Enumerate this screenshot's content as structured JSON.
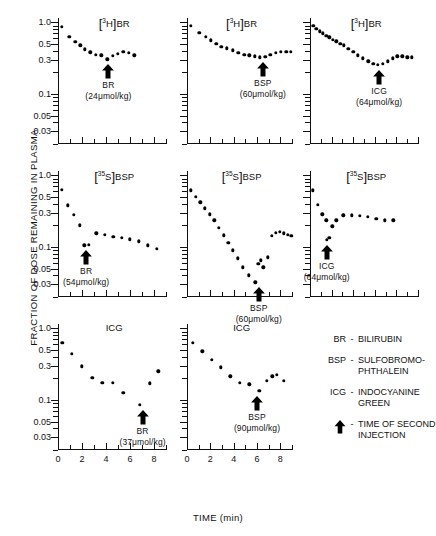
{
  "axes": {
    "ylabel": "FRACTION OF DOSE REMAINING IN PLASMA",
    "xlabel": "TIME (min)",
    "yticklabels": [
      "1.0",
      "0.5",
      "0.3",
      "0.1",
      "0.05",
      "0.03"
    ],
    "ytickvalues": [
      1.0,
      0.5,
      0.3,
      0.1,
      0.05,
      0.03
    ],
    "ylim": [
      0.02,
      1.15
    ],
    "xticklabels_9": [
      "0",
      "2",
      "4",
      "6",
      "8"
    ],
    "xticklabels_10": [
      "0",
      "2",
      "4",
      "6",
      "8",
      "10"
    ],
    "xlim_col12": [
      0,
      9
    ],
    "xlim_col3": [
      0,
      10
    ]
  },
  "legend": {
    "rows": [
      {
        "abbr": "BR",
        "dash": "-",
        "text": "BILIRUBIN"
      },
      {
        "abbr": "BSP",
        "dash": "-",
        "text": "SULFOBROMO-\nPHTHALEIN"
      },
      {
        "abbr": "ICG",
        "dash": "-",
        "text": "INDOCYANINE\nGREEN"
      },
      {
        "abbr": "arrow-icon",
        "dash": "-",
        "text": "TIME OF SECOND\nINJECTION"
      }
    ]
  },
  "chart_data": {
    "type": "scatter",
    "xlabel": "TIME (min)",
    "ylabel": "FRACTION OF DOSE REMAINING IN PLASMA",
    "yscale": "log",
    "ylim": [
      0.02,
      1.15
    ],
    "panels": [
      {
        "id": "r1c1",
        "row": 1,
        "col": 1,
        "title_html": "[<sup>3</sup>H]BR",
        "tracer": "[3H]BR",
        "xlim": [
          0,
          9
        ],
        "annotation": {
          "line1": "BR",
          "line2": "(24μmol/kg)",
          "arrow_x": 4.2
        },
        "x": [
          0.3,
          0.95,
          1.45,
          1.85,
          2.25,
          2.7,
          3.15,
          3.6,
          4.1,
          4.55,
          5.0,
          5.45,
          5.9,
          6.35
        ],
        "y": [
          0.87,
          0.63,
          0.54,
          0.48,
          0.42,
          0.38,
          0.355,
          0.345,
          0.305,
          0.34,
          0.365,
          0.385,
          0.375,
          0.345
        ]
      },
      {
        "id": "r1c2",
        "row": 1,
        "col": 2,
        "title_html": "[<sup>3</sup>H]BR",
        "tracer": "[3H]BR",
        "xlim": [
          0,
          9
        ],
        "annotation": {
          "line1": "BSP",
          "line2": "(60μmol/kg)",
          "arrow_x": 6.5
        },
        "x": [
          0.35,
          1.05,
          1.6,
          2.05,
          2.5,
          2.95,
          3.4,
          3.9,
          4.4,
          4.9,
          5.35,
          5.8,
          6.25,
          6.7,
          7.15,
          7.6,
          8.05,
          8.5,
          8.9
        ],
        "y": [
          0.9,
          0.72,
          0.63,
          0.56,
          0.5,
          0.455,
          0.435,
          0.405,
          0.375,
          0.355,
          0.345,
          0.335,
          0.325,
          0.33,
          0.355,
          0.375,
          0.385,
          0.385,
          0.385
        ]
      },
      {
        "id": "r1c3",
        "row": 1,
        "col": 3,
        "title_html": "[<sup>3</sup>H]BR",
        "tracer": "[3H]BR",
        "xlim": [
          0,
          10
        ],
        "annotation": {
          "line1": "ICG",
          "line2": "(64μmol/kg)",
          "arrow_x": 6.4
        },
        "x": [
          0.3,
          0.6,
          0.9,
          1.2,
          1.5,
          1.8,
          2.1,
          2.45,
          2.8,
          3.15,
          3.55,
          4.0,
          4.45,
          4.9,
          5.4,
          5.85,
          6.3,
          6.75,
          7.2,
          7.65,
          8.1,
          8.55,
          9.0,
          9.4
        ],
        "y": [
          0.9,
          0.82,
          0.75,
          0.7,
          0.655,
          0.615,
          0.575,
          0.545,
          0.505,
          0.475,
          0.425,
          0.385,
          0.345,
          0.315,
          0.285,
          0.265,
          0.255,
          0.265,
          0.285,
          0.315,
          0.335,
          0.335,
          0.325,
          0.325
        ]
      },
      {
        "id": "r2c1",
        "row": 2,
        "col": 1,
        "title_html": "[<sup>35</sup>S]BSP",
        "tracer": "[35S]BSP",
        "xlim": [
          0,
          9
        ],
        "annotation": {
          "line1": "BR",
          "line2": "(54μmol/kg)",
          "arrow_x": 2.35
        },
        "x": [
          0.3,
          0.8,
          1.3,
          1.8,
          2.2,
          2.55,
          3.2,
          3.9,
          4.6,
          5.3,
          6.0,
          6.75,
          7.5,
          8.25
        ],
        "y": [
          0.63,
          0.38,
          0.28,
          0.2,
          0.105,
          0.108,
          0.155,
          0.148,
          0.138,
          0.133,
          0.128,
          0.12,
          0.105,
          0.095
        ]
      },
      {
        "id": "r2c2",
        "row": 2,
        "col": 2,
        "title_html": "[<sup>35</sup>S]BSP",
        "tracer": "[35S]BSP",
        "xlim": [
          0,
          9
        ],
        "annotation": {
          "line1": "BSP",
          "line2": "(60μmol/kg)",
          "arrow_x": 6.15
        },
        "x": [
          0.3,
          0.75,
          1.15,
          1.55,
          1.95,
          2.35,
          2.75,
          3.15,
          3.55,
          3.95,
          4.35,
          4.8,
          5.3,
          5.85,
          6.1,
          6.35,
          6.55,
          6.9,
          7.25,
          7.6,
          7.95,
          8.3,
          8.65,
          8.95
        ],
        "y": [
          0.62,
          0.5,
          0.42,
          0.345,
          0.285,
          0.235,
          0.185,
          0.145,
          0.115,
          0.09,
          0.069,
          0.052,
          0.04,
          0.032,
          0.058,
          0.065,
          0.052,
          0.072,
          0.142,
          0.158,
          0.163,
          0.155,
          0.148,
          0.142
        ]
      },
      {
        "id": "r2c3",
        "row": 2,
        "col": 3,
        "title_html": "[<sup>35</sup>S]BSP",
        "tracer": "[35S]BSP",
        "xlim": [
          0,
          10
        ],
        "annotation": {
          "line1": "ICG",
          "line2": "(64μmol/kg)",
          "arrow_x": 1.55
        },
        "x": [
          0.25,
          0.75,
          1.15,
          1.5,
          1.55,
          1.8,
          2.05,
          2.45,
          3.1,
          3.85,
          4.6,
          5.35,
          6.15,
          6.95,
          7.7
        ],
        "y": [
          0.62,
          0.385,
          0.285,
          0.235,
          0.125,
          0.135,
          0.195,
          0.235,
          0.275,
          0.275,
          0.27,
          0.265,
          0.245,
          0.235,
          0.235
        ]
      },
      {
        "id": "r3c1",
        "row": 3,
        "col": 1,
        "title_html": "ICG",
        "tracer": "ICG",
        "xlim": [
          0,
          9
        ],
        "annotation": {
          "line1": "BR",
          "line2": "(37μmol/kg)",
          "arrow_x": 7.05
        },
        "x": [
          0.35,
          1.15,
          2.0,
          2.85,
          3.7,
          4.55,
          5.45,
          6.8,
          7.65,
          8.35
        ],
        "y": [
          0.63,
          0.44,
          0.295,
          0.205,
          0.175,
          0.175,
          0.125,
          0.085,
          0.17,
          0.25
        ]
      },
      {
        "id": "r3c2",
        "row": 3,
        "col": 2,
        "title_html": "ICG",
        "tracer": "ICG",
        "xlim": [
          0,
          9
        ],
        "annotation": {
          "line1": "BSP",
          "line2": "(90μmol/kg)",
          "arrow_x": 6.0
        },
        "x": [
          0.5,
          1.3,
          2.1,
          2.9,
          3.7,
          4.5,
          5.35,
          6.2,
          6.85,
          7.3,
          7.7,
          8.3
        ],
        "y": [
          0.63,
          0.48,
          0.365,
          0.285,
          0.215,
          0.175,
          0.165,
          0.135,
          0.185,
          0.215,
          0.225,
          0.185
        ]
      }
    ]
  }
}
